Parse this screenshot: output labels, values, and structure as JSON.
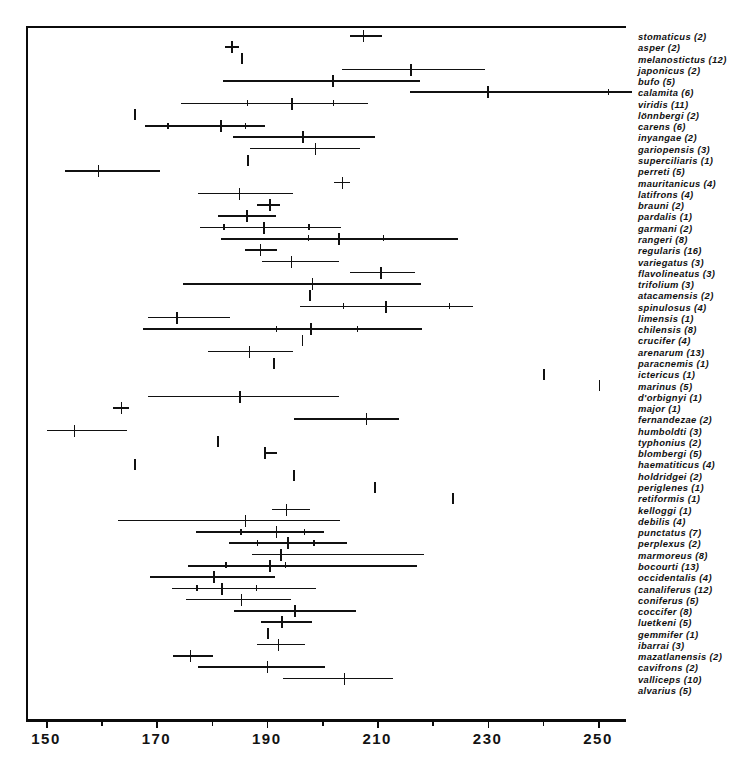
{
  "figure": {
    "title": "",
    "axis": {
      "xlabel": "",
      "ylabel": "",
      "tick_labels": [
        "150",
        "170",
        "190",
        "210",
        "230",
        "250"
      ],
      "tick_values": [
        150,
        170,
        190,
        210,
        230,
        250
      ],
      "minor_tick_values": [
        160,
        180,
        200,
        220,
        240,
        260
      ],
      "xlim": [
        146,
        256
      ]
    }
  },
  "chart_data": {
    "type": "scatter",
    "title": "",
    "xlabel": "",
    "ylabel": "",
    "xlim": [
      146,
      256
    ],
    "grid": false,
    "legend": "none",
    "x_unit_per_px": 0.1812,
    "categories": [
      "stomaticus (2)",
      "asper (2)",
      "melanostictus (12)",
      "japonicus (2)",
      "bufo (5)",
      "calamita (6)",
      "viridis (11)",
      "lönnbergi (2)",
      "carens (6)",
      "inyangae (2)",
      "gariopensis (3)",
      "superciliaris (1)",
      "perreti (5)",
      "mauritanicus (4)",
      "latifrons (4)",
      "brauni (2)",
      "pardalis (1)",
      "garmani (2)",
      "rangeri (8)",
      "regularis (16)",
      "variegatus (3)",
      "flavolineatus (3)",
      "trifolium (3)",
      "atacamensis (2)",
      "spinulosus (4)",
      "limensis (1)",
      "chilensis (8)",
      "crucifer (4)",
      "arenarum (13)",
      "paracnemis (1)",
      "ictericus (1)",
      "marinus (5)",
      "d'orbignyi (1)",
      "major (1)",
      "fernandezae (2)",
      "humboldti (3)",
      "typhonius (2)",
      "blombergi (5)",
      "haematiticus (4)",
      "holdridgei (2)",
      "periglenes (1)",
      "retiformis (1)",
      "kelloggi (1)",
      "debilis (4)",
      "punctatus (7)",
      "perplexus (2)",
      "marmoreus (8)",
      "bocourti (13)",
      "occidentalis (4)",
      "canaliferus (12)",
      "coniferus (5)",
      "coccifer (8)",
      "luetkeni (5)",
      "gemmifer (1)",
      "ibarrai (3)",
      "mazatlanensis (2)",
      "cavifrons (2)",
      "valliceps (10)",
      "alvarius (5)"
    ],
    "rows": [
      {
        "label": "stomaticus (2)",
        "n": 2,
        "min": 205.0,
        "max": 210.9,
        "mean": 207.4,
        "sd_marks": [],
        "style": "plus"
      },
      {
        "label": "asper (2)",
        "n": 2,
        "min": 182.5,
        "max": 185.0,
        "mean": 183.6,
        "sd_marks": [],
        "style": "plus"
      },
      {
        "label": "melanostictus (12)",
        "n": 12,
        "min": 185.4,
        "max": 185.4,
        "mean": 185.4,
        "sd_marks": [],
        "style": "single"
      },
      {
        "label": "japonicus (2)",
        "n": 2,
        "min": 203.6,
        "max": 229.6,
        "mean": 216.0,
        "sd_marks": [],
        "style": "range"
      },
      {
        "label": "bufo (5)",
        "n": 5,
        "min": 182.1,
        "max": 217.7,
        "mean": 201.8,
        "sd_marks": [],
        "style": "range"
      },
      {
        "label": "calamita (6)",
        "n": 6,
        "min": 215.9,
        "max": 256.1,
        "mean": 229.9,
        "sd_marks": [
          251.8
        ],
        "style": "range"
      },
      {
        "label": "viridis (11)",
        "n": 11,
        "min": 174.4,
        "max": 208.3,
        "mean": 194.4,
        "sd_marks": [
          186.4,
          202.0
        ],
        "style": "range"
      },
      {
        "label": "lönnbergi (2)",
        "n": 2,
        "min": 166.0,
        "max": 166.0,
        "mean": 166.0,
        "sd_marks": [],
        "style": "single"
      },
      {
        "label": "carens (6)",
        "n": 6,
        "min": 167.9,
        "max": 189.6,
        "mean": 181.6,
        "sd_marks": [
          172.0,
          186.0
        ],
        "style": "range"
      },
      {
        "label": "inyangae (2)",
        "n": 2,
        "min": 183.8,
        "max": 209.6,
        "mean": 196.4,
        "sd_marks": [],
        "style": "range"
      },
      {
        "label": "gariopensis (3)",
        "n": 3,
        "min": 186.9,
        "max": 206.8,
        "mean": 198.7,
        "sd_marks": [],
        "style": "range"
      },
      {
        "label": "superciliaris (1)",
        "n": 1,
        "min": 186.4,
        "max": 186.4,
        "mean": 186.4,
        "sd_marks": [],
        "style": "single"
      },
      {
        "label": "perreti (5)",
        "n": 5,
        "min": 153.4,
        "max": 170.6,
        "mean": 159.4,
        "sd_marks": [],
        "style": "range"
      },
      {
        "label": "mauritanicus (4)",
        "n": 4,
        "min": 202.2,
        "max": 205.1,
        "mean": 203.6,
        "sd_marks": [],
        "style": "plus"
      },
      {
        "label": "latifrons (4)",
        "n": 4,
        "min": 177.6,
        "max": 194.8,
        "mean": 184.9,
        "sd_marks": [],
        "style": "range"
      },
      {
        "label": "brauni (2)",
        "n": 2,
        "min": 188.2,
        "max": 192.4,
        "mean": 190.4,
        "sd_marks": [],
        "style": "plus"
      },
      {
        "label": "pardalis (1)",
        "n": 1,
        "min": 181.2,
        "max": 191.7,
        "mean": 186.3,
        "sd_marks": [],
        "style": "range"
      },
      {
        "label": "garmani (2)",
        "n": 2,
        "min": 177.9,
        "max": 203.4,
        "mean": 189.4,
        "sd_marks": [
          182.1,
          197.5
        ],
        "style": "range"
      },
      {
        "label": "rangeri (8)",
        "n": 8,
        "min": 181.7,
        "max": 224.7,
        "mean": 202.9,
        "sd_marks": [
          197.4,
          211.0
        ],
        "style": "range"
      },
      {
        "label": "regularis (16)",
        "n": 16,
        "min": 186.0,
        "max": 191.8,
        "mean": 188.7,
        "sd_marks": [],
        "style": "plus"
      },
      {
        "label": "variegatus (3)",
        "n": 3,
        "min": 189.2,
        "max": 203.0,
        "mean": 194.3,
        "sd_marks": [],
        "style": "range"
      },
      {
        "label": "flavolineatus (3)",
        "n": 3,
        "min": 205.0,
        "max": 216.8,
        "mean": 210.5,
        "sd_marks": [],
        "style": "range"
      },
      {
        "label": "trifolium (3)",
        "n": 3,
        "min": 174.8,
        "max": 217.9,
        "mean": 198.1,
        "sd_marks": [],
        "style": "range"
      },
      {
        "label": "atacamensis (2)",
        "n": 2,
        "min": 197.6,
        "max": 197.6,
        "mean": 197.6,
        "sd_marks": [],
        "style": "single"
      },
      {
        "label": "spinulosus (4)",
        "n": 4,
        "min": 196.1,
        "max": 227.4,
        "mean": 211.4,
        "sd_marks": [
          203.8,
          223.0
        ],
        "style": "range"
      },
      {
        "label": "limensis (1)",
        "n": 1,
        "min": 168.4,
        "max": 183.3,
        "mean": 173.6,
        "sd_marks": [],
        "style": "range"
      },
      {
        "label": "chilensis (8)",
        "n": 8,
        "min": 167.5,
        "max": 218.2,
        "mean": 197.9,
        "sd_marks": [
          191.6,
          206.3
        ],
        "style": "range"
      },
      {
        "label": "crucifer (4)",
        "n": 4,
        "min": 196.3,
        "max": 196.3,
        "mean": 196.3,
        "sd_marks": [],
        "style": "single"
      },
      {
        "label": "arenarum (13)",
        "n": 13,
        "min": 179.3,
        "max": 194.7,
        "mean": 186.7,
        "sd_marks": [],
        "style": "range"
      },
      {
        "label": "paracnemis (1)",
        "n": 1,
        "min": 191.2,
        "max": 191.2,
        "mean": 191.2,
        "sd_marks": [],
        "style": "single"
      },
      {
        "label": "ictericus (1)",
        "n": 1,
        "min": 240.1,
        "max": 240.1,
        "mean": 240.1,
        "sd_marks": [],
        "style": "single"
      },
      {
        "label": "marinus (5)",
        "n": 5,
        "min": 250.1,
        "max": 250.1,
        "mean": 250.1,
        "sd_marks": [],
        "style": "single"
      },
      {
        "label": "d'orbignyi (1)",
        "n": 1,
        "min": 168.5,
        "max": 203.0,
        "mean": 185.0,
        "sd_marks": [],
        "style": "range"
      },
      {
        "label": "major (1)",
        "n": 1,
        "min": 162.1,
        "max": 165.0,
        "mean": 163.5,
        "sd_marks": [],
        "style": "plus"
      },
      {
        "label": "fernandezae (2)",
        "n": 2,
        "min": 194.9,
        "max": 213.9,
        "mean": 207.9,
        "sd_marks": [],
        "style": "range"
      },
      {
        "label": "humboldti (3)",
        "n": 3,
        "min": 150.1,
        "max": 164.6,
        "mean": 155.0,
        "sd_marks": [],
        "style": "range"
      },
      {
        "label": "typhonius (2)",
        "n": 2,
        "min": 180.1,
        "max": 181.9,
        "mean": 181.0,
        "sd_marks": [],
        "style": "single"
      },
      {
        "label": "blombergi (5)",
        "n": 5,
        "min": 189.5,
        "max": 189.5,
        "mean": 189.5,
        "sd_marks": [],
        "style": "plus"
      },
      {
        "label": "haematiticus (4)",
        "n": 4,
        "min": 166.0,
        "max": 166.0,
        "mean": 166.0,
        "sd_marks": [],
        "style": "single"
      },
      {
        "label": "holdridgei (2)",
        "n": 2,
        "min": 194.7,
        "max": 194.7,
        "mean": 194.7,
        "sd_marks": [],
        "style": "single"
      },
      {
        "label": "periglenes (1)",
        "n": 1,
        "min": 209.5,
        "max": 209.5,
        "mean": 209.5,
        "sd_marks": [],
        "style": "single"
      },
      {
        "label": "retiformis (1)",
        "n": 1,
        "min": 223.5,
        "max": 223.5,
        "mean": 223.5,
        "sd_marks": [],
        "style": "single"
      },
      {
        "label": "kelloggi (1)",
        "n": 1,
        "min": 191.0,
        "max": 197.8,
        "mean": 193.4,
        "sd_marks": [],
        "style": "plus"
      },
      {
        "label": "debilis (4)",
        "n": 4,
        "min": 163.1,
        "max": 203.2,
        "mean": 186.0,
        "sd_marks": [],
        "style": "range"
      },
      {
        "label": "punctatus (7)",
        "n": 7,
        "min": 177.1,
        "max": 200.3,
        "mean": 191.6,
        "sd_marks": [
          185.2,
          196.7
        ],
        "style": "range"
      },
      {
        "label": "perplexus (2)",
        "n": 2,
        "min": 183.2,
        "max": 204.6,
        "mean": 193.7,
        "sd_marks": [
          188.2,
          198.4
        ],
        "style": "range"
      },
      {
        "label": "marmoreus (8)",
        "n": 8,
        "min": 187.4,
        "max": 218.4,
        "mean": 192.4,
        "sd_marks": [],
        "style": "range"
      },
      {
        "label": "bocourti (13)",
        "n": 13,
        "min": 175.7,
        "max": 217.3,
        "mean": 190.4,
        "sd_marks": [
          182.5,
          193.3
        ],
        "style": "range"
      },
      {
        "label": "occidentalis (4)",
        "n": 4,
        "min": 168.8,
        "max": 191.4,
        "mean": 180.3,
        "sd_marks": [],
        "style": "range"
      },
      {
        "label": "canaliferus (12)",
        "n": 12,
        "min": 172.8,
        "max": 198.9,
        "mean": 181.7,
        "sd_marks": [
          177.2,
          188.0
        ],
        "style": "range"
      },
      {
        "label": "coniferus (5)",
        "n": 5,
        "min": 175.3,
        "max": 194.4,
        "mean": 185.3,
        "sd_marks": [],
        "style": "range"
      },
      {
        "label": "coccifer (8)",
        "n": 8,
        "min": 184.1,
        "max": 206.2,
        "mean": 195.0,
        "sd_marks": [],
        "style": "range"
      },
      {
        "label": "luetkeni (5)",
        "n": 5,
        "min": 188.9,
        "max": 198.2,
        "mean": 192.6,
        "sd_marks": [],
        "style": "plus"
      },
      {
        "label": "gemmifer (1)",
        "n": 1,
        "min": 190.0,
        "max": 190.0,
        "mean": 190.0,
        "sd_marks": [],
        "style": "single"
      },
      {
        "label": "ibarrai (3)",
        "n": 3,
        "min": 188.3,
        "max": 196.9,
        "mean": 192.0,
        "sd_marks": [],
        "style": "plus"
      },
      {
        "label": "mazatlanensis (2)",
        "n": 2,
        "min": 173.0,
        "max": 180.2,
        "mean": 176.0,
        "sd_marks": [],
        "style": "plus"
      },
      {
        "label": "cavifrons (2)",
        "n": 2,
        "min": 177.6,
        "max": 200.6,
        "mean": 190.0,
        "sd_marks": [],
        "style": "range"
      },
      {
        "label": "valliceps (10)",
        "n": 10,
        "min": 193.0,
        "max": 212.9,
        "mean": 203.9,
        "sd_marks": [],
        "style": "range"
      },
      {
        "label": "alvarius (5)",
        "n": 5,
        "min": 205.0,
        "max": 210.9,
        "mean": 207.4,
        "sd_marks": [],
        "style": "hidden"
      }
    ]
  }
}
